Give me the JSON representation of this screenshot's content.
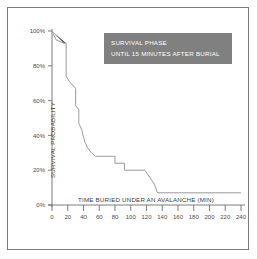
{
  "figure": {
    "border_color": "#7b7b7b",
    "background": "#ffffff"
  },
  "annotation": {
    "line1": "SURVIVAL PHASE",
    "line2": "UNTIL 15 MINUTES AFTER BURIAL",
    "box_color": "#808080",
    "text_color": "#ffffff"
  },
  "chart_data": {
    "type": "line",
    "title": "",
    "xlabel": "TIME BURIED UNDER AN AVALANCHE (MIN)",
    "ylabel": "SURVIVAL PROBABILITY",
    "xlim": [
      0,
      240
    ],
    "ylim": [
      0,
      100
    ],
    "grid": false,
    "legend": null,
    "line_color": "#8a8a8a",
    "fill_color": "#4d4d4d",
    "xticks": [
      0,
      20,
      40,
      60,
      80,
      100,
      120,
      140,
      160,
      180,
      200,
      220,
      240
    ],
    "xtick_labels": [
      "0",
      "20",
      "40",
      "60",
      "80",
      "100",
      "120",
      "140",
      "160",
      "180",
      "200",
      "220",
      "240"
    ],
    "yticks": [
      0,
      20,
      40,
      60,
      80,
      100
    ],
    "ytick_labels": [
      "0%",
      "20%",
      "40%",
      "60%",
      "80%",
      "100%"
    ],
    "series": [
      {
        "name": "Survival probability",
        "x": [
          0,
          5,
          10,
          15,
          18,
          18,
          22,
          26,
          30,
          30,
          34,
          34,
          38,
          40,
          42,
          45,
          50,
          55,
          58,
          62,
          66,
          70,
          74,
          78,
          80,
          80,
          92,
          92,
          118,
          118,
          130,
          134,
          240
        ],
        "values": [
          100,
          95,
          94,
          93,
          93,
          74,
          71,
          69,
          67,
          57,
          55,
          47,
          43,
          39,
          36,
          33,
          30,
          28,
          28,
          28,
          28,
          28,
          28,
          28,
          28,
          24,
          24,
          20,
          20,
          20,
          12,
          7,
          7
        ]
      }
    ],
    "shaded_region": {
      "name": "survival-phase-fill",
      "x": [
        0,
        15,
        18,
        0
      ],
      "values": [
        100,
        93,
        93,
        100
      ],
      "color": "#4d4d4d"
    }
  }
}
